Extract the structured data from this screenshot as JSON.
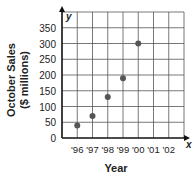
{
  "chart_data": {
    "type": "scatter",
    "title": "",
    "xlabel": "Year",
    "ylabel_line1": "October Sales",
    "ylabel_line2": "($ millions)",
    "x_axis_letter": "x",
    "y_axis_letter": "y",
    "categories": [
      "'96",
      "'97",
      "'98",
      "'99",
      "'00",
      "'01",
      "'02"
    ],
    "yticks": [
      0,
      50,
      100,
      150,
      200,
      250,
      300,
      350
    ],
    "ylim": [
      0,
      400
    ],
    "grid": true,
    "legend": null,
    "series": [
      {
        "name": "October Sales",
        "points": [
          {
            "x": "'96",
            "y": 40
          },
          {
            "x": "'97",
            "y": 70
          },
          {
            "x": "'98",
            "y": 130
          },
          {
            "x": "'99",
            "y": 190
          },
          {
            "x": "'00",
            "y": 300
          }
        ]
      }
    ],
    "colors": {
      "point": "#555555",
      "grid": "#555555",
      "axis": "#111111",
      "text": "#222222"
    }
  }
}
